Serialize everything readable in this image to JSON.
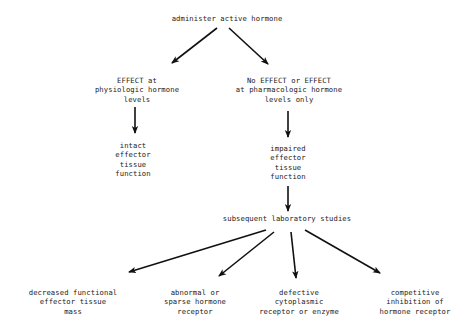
{
  "diagram": {
    "nodes": {
      "root": {
        "label": "administer active hormone"
      },
      "effect_physiologic": {
        "label": "EFFECT at\nphysiologic hormone\nlevels"
      },
      "no_effect": {
        "label": "No EFFECT or EFFECT\nat pharmacologic hormone\nlevels only"
      },
      "intact": {
        "label": "intact\neffector\ntissue\nfunction"
      },
      "impaired": {
        "label": "impaired\neffector\ntissue\nfunction"
      },
      "lab_studies": {
        "label": "subsequent laboratory studies"
      },
      "decreased_mass": {
        "label": "decreased functional\neffector tissue\nmass"
      },
      "abnormal_receptor": {
        "label": "abnormal or\nsparse hormone\nreceptor"
      },
      "defective_cytoplasmic": {
        "label": "defective\ncytoplasmic\nreceptor or enzyme"
      },
      "competitive_inhibition": {
        "label": "competitive\ninhibition of\nhormone receptor"
      }
    },
    "edges": [
      {
        "from": "root",
        "to": "effect_physiologic"
      },
      {
        "from": "root",
        "to": "no_effect"
      },
      {
        "from": "effect_physiologic",
        "to": "intact"
      },
      {
        "from": "no_effect",
        "to": "impaired"
      },
      {
        "from": "impaired",
        "to": "lab_studies"
      },
      {
        "from": "lab_studies",
        "to": "decreased_mass"
      },
      {
        "from": "lab_studies",
        "to": "abnormal_receptor"
      },
      {
        "from": "lab_studies",
        "to": "defective_cytoplasmic"
      },
      {
        "from": "lab_studies",
        "to": "competitive_inhibition"
      }
    ],
    "colors": {
      "line": "#111111",
      "text": "#1a1a1a",
      "background": "#ffffff"
    }
  }
}
